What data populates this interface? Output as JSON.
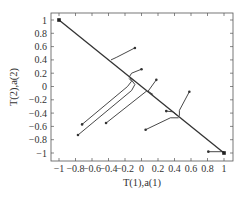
{
  "chart_data": {
    "type": "line",
    "title": "",
    "xlabel": "T(1),a(1)",
    "ylabel": "T(2),a(2)",
    "xlim": [
      -1.1,
      1.1
    ],
    "ylim": [
      -1.1,
      1.1
    ],
    "grid": false,
    "legend": null,
    "xticks": [
      -1,
      -0.8,
      -0.6,
      -0.4,
      -0.2,
      0,
      0.2,
      0.4,
      0.6,
      0.8,
      1
    ],
    "xtick_labels": [
      "−1",
      "−0.8",
      "−0.6",
      "−0.4",
      "−0.2",
      "0",
      "0.2",
      "0.4",
      "0.6",
      "0.8",
      "1"
    ],
    "yticks": [
      1,
      0.8,
      0.6,
      0.4,
      0.2,
      0,
      -0.2,
      -0.4,
      -0.6,
      -0.8,
      -1
    ],
    "ytick_labels": [
      "1",
      "0.8",
      "0.6",
      "0.4",
      "0.2",
      "0",
      "−0.2",
      "−0.4",
      "−0.6",
      "−0.8",
      "−1"
    ],
    "markers": [
      {
        "x": -1,
        "y": 1,
        "label": "attractor-top-left"
      },
      {
        "x": 1,
        "y": -1,
        "label": "attractor-bottom-right"
      }
    ],
    "series": [
      {
        "name": "diagonal",
        "points": [
          [
            -1,
            1
          ],
          [
            1,
            -1
          ]
        ]
      },
      {
        "name": "traj-1",
        "points": [
          [
            -0.08,
            0.58
          ],
          [
            -0.3,
            0.44
          ],
          [
            -0.37,
            0.4
          ]
        ]
      },
      {
        "name": "traj-2",
        "points": [
          [
            0.0,
            0.26
          ],
          [
            -0.12,
            0.2
          ],
          [
            -0.15,
            0.14
          ]
        ]
      },
      {
        "name": "traj-3",
        "points": [
          [
            -0.72,
            -0.57
          ],
          [
            -0.17,
            0.0
          ],
          [
            -0.12,
            0.08
          ],
          [
            -0.15,
            0.12
          ]
        ]
      },
      {
        "name": "traj-4",
        "points": [
          [
            -0.77,
            -0.73
          ],
          [
            -0.12,
            -0.06
          ],
          [
            -0.08,
            0.03
          ],
          [
            -0.14,
            0.13
          ]
        ]
      },
      {
        "name": "traj-5",
        "points": [
          [
            0.18,
            0.1
          ],
          [
            0.08,
            -0.07
          ],
          [
            0.14,
            -0.12
          ]
        ]
      },
      {
        "name": "traj-6",
        "points": [
          [
            -0.43,
            -0.55
          ],
          [
            0.06,
            -0.07
          ],
          [
            0.08,
            -0.08
          ]
        ]
      },
      {
        "name": "traj-7",
        "points": [
          [
            0.58,
            -0.08
          ],
          [
            0.46,
            -0.36
          ],
          [
            0.46,
            -0.44
          ]
        ]
      },
      {
        "name": "traj-8",
        "points": [
          [
            0.3,
            -0.37
          ],
          [
            0.38,
            -0.38
          ],
          [
            0.44,
            -0.44
          ]
        ]
      },
      {
        "name": "traj-9",
        "points": [
          [
            0.05,
            -0.65
          ],
          [
            0.35,
            -0.47
          ],
          [
            0.45,
            -0.47
          ]
        ]
      },
      {
        "name": "traj-10",
        "points": [
          [
            0.81,
            -0.98
          ],
          [
            1,
            -0.98
          ],
          [
            1,
            -1
          ]
        ]
      }
    ]
  }
}
